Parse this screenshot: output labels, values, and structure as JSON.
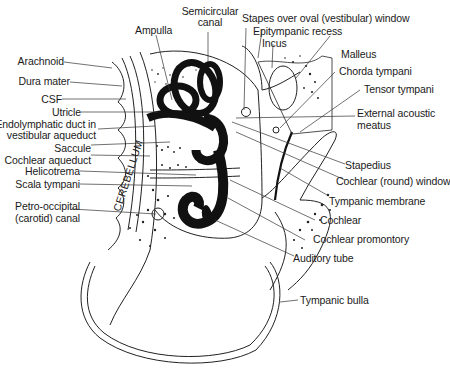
{
  "figure": {
    "type": "anatomical cross-section diagram",
    "vertical_text": "CEREBELLUM",
    "labels_left": [
      {
        "text": "Arachnoid"
      },
      {
        "text": "Dura mater"
      },
      {
        "text": "CSF"
      },
      {
        "text": "Utricle"
      },
      {
        "text": "Endolymphatic duct in"
      },
      {
        "text": "vestibular aqueduct"
      },
      {
        "text": "Saccule"
      },
      {
        "text": "Cochlear aqueduct"
      },
      {
        "text": "Helicotrema"
      },
      {
        "text": "Scala tympani"
      },
      {
        "text": "Petro-occipital"
      },
      {
        "text": "(carotid) canal"
      }
    ],
    "labels_top": [
      {
        "text": "Ampulla"
      },
      {
        "text": "Semicircular"
      },
      {
        "text": "canal"
      },
      {
        "text": "Stapes over oval (vestibular) window"
      },
      {
        "text": "Epitympanic recess"
      },
      {
        "text": "Incus"
      }
    ],
    "labels_right": [
      {
        "text": "Malleus"
      },
      {
        "text": "Chorda tympani"
      },
      {
        "text": "Tensor tympani"
      },
      {
        "text": "External acoustic"
      },
      {
        "text": "meatus"
      },
      {
        "text": "Stapedius"
      },
      {
        "text": "Cochlear (round) window"
      },
      {
        "text": "Tympanic membrane"
      },
      {
        "text": "Cochlear"
      },
      {
        "text": "Cochlear promontory"
      },
      {
        "text": "Auditory tube"
      },
      {
        "text": "Tympanic bulla"
      }
    ]
  }
}
